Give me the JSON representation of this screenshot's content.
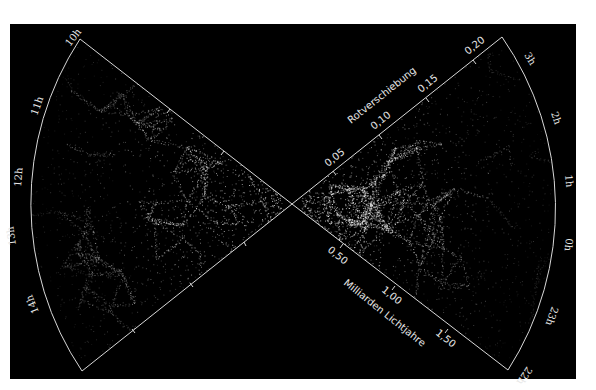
{
  "figure": {
    "type": "galaxy-redshift-survey-wedge-diagram",
    "background": "#000000",
    "line_color": "#d8d8d8",
    "text_color": "#e6e6e6"
  },
  "redshift_axis": {
    "title": "Rotverschiebung",
    "ticks": [
      "0,05",
      "0,10",
      "0,15",
      "0,20"
    ]
  },
  "distance_axis": {
    "title": "Milliarden Lichtjahre",
    "ticks": [
      "0,50",
      "1,00",
      "1,50"
    ]
  },
  "left_wedge": {
    "ra_labels": [
      "10h",
      "11h",
      "12h",
      "13h",
      "14h"
    ]
  },
  "right_wedge": {
    "ra_labels": [
      "3h",
      "2h",
      "1h",
      "0h",
      "23h",
      "22h"
    ]
  }
}
